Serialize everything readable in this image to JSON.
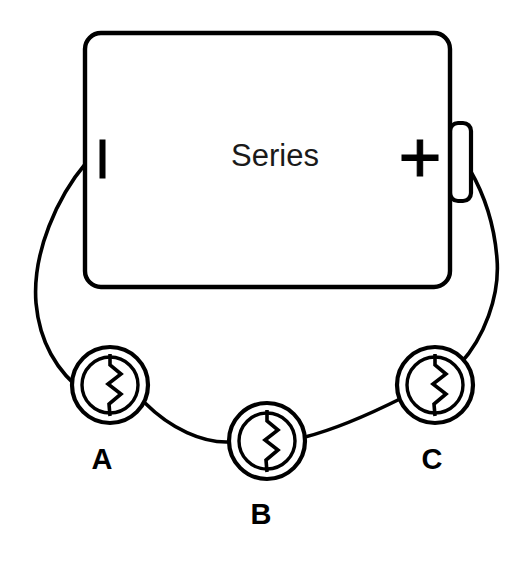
{
  "diagram": {
    "title": "Series",
    "type": "series-circuit",
    "background_color": "#ffffff",
    "stroke_color": "#000000"
  },
  "battery": {
    "label": "Series",
    "negative_terminal_mark": "|",
    "positive_terminal_mark": "+",
    "negative_terminal_name": "negative",
    "positive_terminal_name": "positive",
    "body": {
      "x": 85,
      "y": 33,
      "width": 365,
      "height": 254,
      "radius": 16
    },
    "nub": {
      "x": 450,
      "y": 123,
      "width": 21,
      "height": 78,
      "radius": 8
    }
  },
  "resistors": [
    {
      "label": "A",
      "name": "resistor-a",
      "cx": 110,
      "cy": 385,
      "outer_r": 38,
      "inner_r": 28,
      "label_x": 102,
      "label_y": 461
    },
    {
      "label": "B",
      "name": "resistor-b",
      "cx": 267,
      "cy": 441,
      "outer_r": 38,
      "inner_r": 28,
      "label_x": 261,
      "label_y": 516
    },
    {
      "label": "C",
      "name": "resistor-c",
      "cx": 435,
      "cy": 385,
      "outer_r": 38,
      "inner_r": 28,
      "label_x": 432,
      "label_y": 461
    }
  ],
  "wires": [
    {
      "name": "wire-negative-to-a",
      "from": "battery-negative",
      "to": "resistor-a",
      "path": "M 86 163 C 58 196 32 252 36 303 C 40 348 62 376 86 394"
    },
    {
      "name": "wire-a-to-b",
      "from": "resistor-a",
      "to": "resistor-b",
      "path": "M 145 403 C 171 429 203 443 229 442"
    },
    {
      "name": "wire-b-to-c",
      "from": "resistor-b",
      "to": "resistor-c",
      "path": "M 305 437 C 340 428 376 411 402 398"
    },
    {
      "name": "wire-c-to-positive",
      "from": "resistor-c",
      "to": "battery-positive",
      "path": "M 460 364 C 484 338 500 296 497 259 C 494 219 481 189 470 170"
    }
  ],
  "terminal_marks": {
    "negative_bar": {
      "x": 100,
      "y": 140,
      "width": 5,
      "height": 38
    },
    "plus_x": 420,
    "plus_y": 158
  }
}
